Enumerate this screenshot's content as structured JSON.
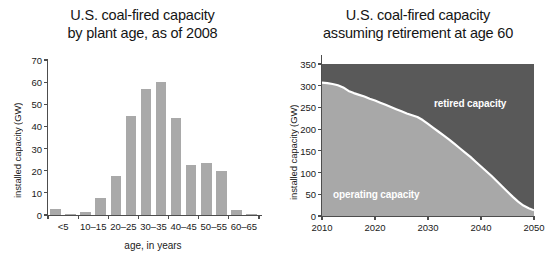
{
  "chart_data": [
    {
      "type": "bar",
      "id": "coal-capacity-by-plant-age",
      "title": "U.S. coal-fired capacity",
      "title_line2": "by plant age, as of 2008",
      "xlabel": "age, in years",
      "ylabel": "installed capacity (GW)",
      "ylim": [
        0,
        70
      ],
      "yticks": [
        0,
        10,
        20,
        30,
        40,
        50,
        60,
        70
      ],
      "grid": false,
      "bar_color": "#a9a9a9",
      "categories": [
        "<5",
        "5–10",
        "10–15",
        "15–20",
        "20–25",
        "25–30",
        "30–35",
        "35–40",
        "40–45",
        "45–50",
        "50–55",
        "55–60",
        "60–65",
        "65–70"
      ],
      "values": [
        2.5,
        0.5,
        1.3,
        7.8,
        17.7,
        44.8,
        56.8,
        60.0,
        43.7,
        22.5,
        23.5,
        20.0,
        2.2,
        0.5
      ],
      "xtick_labels": [
        "<5",
        "10–15",
        "20–25",
        "30–35",
        "40–45",
        "50–55",
        "60–65"
      ],
      "xtick_label_indices": [
        0,
        2,
        4,
        6,
        8,
        10,
        12
      ]
    },
    {
      "type": "area",
      "id": "coal-capacity-retirement-at-60",
      "title": "U.S. coal-fired capacity",
      "title_line2": "assuming retirement at age 60",
      "xlabel": "",
      "ylabel": "installed capacity (GW)",
      "ylim": [
        0,
        350
      ],
      "yticks": [
        0,
        50,
        100,
        150,
        200,
        250,
        300,
        350
      ],
      "xlim": [
        2010,
        2050
      ],
      "xticks": [
        2010,
        2020,
        2030,
        2040,
        2050
      ],
      "xtick_labels": [
        "2010",
        "2020",
        "2030",
        "2040",
        "2050"
      ],
      "grid": false,
      "legend_position": "inline-annotation",
      "annotations": [
        {
          "name": "retired-capacity",
          "text": "retired capacity",
          "color": "#ffffff"
        },
        {
          "name": "operating-capacity",
          "text": "operating capacity",
          "color": "#ffffff"
        }
      ],
      "colors": {
        "operating": "#a8a8a8",
        "retired": "#595959",
        "divider": "#ffffff"
      },
      "x": [
        2010,
        2011,
        2012,
        2013,
        2014,
        2015,
        2016,
        2017,
        2018,
        2019,
        2020,
        2021,
        2022,
        2023,
        2024,
        2025,
        2026,
        2027,
        2028,
        2029,
        2030,
        2031,
        2032,
        2033,
        2034,
        2035,
        2036,
        2037,
        2038,
        2039,
        2040,
        2041,
        2042,
        2043,
        2044,
        2045,
        2046,
        2047,
        2048,
        2049,
        2050
      ],
      "series": [
        {
          "name": "operating capacity",
          "values": [
            307,
            306,
            304,
            301,
            296,
            288,
            283,
            279,
            275,
            270,
            266,
            261,
            256,
            251,
            246,
            241,
            236,
            232,
            228,
            221,
            212,
            203,
            194,
            185,
            176,
            166,
            156,
            146,
            136,
            125,
            114,
            103,
            92,
            80,
            68,
            56,
            44,
            33,
            24,
            18,
            13
          ]
        },
        {
          "name": "retired capacity",
          "values": [
            0,
            1,
            3,
            6,
            11,
            19,
            24,
            28,
            32,
            37,
            41,
            46,
            51,
            56,
            61,
            66,
            71,
            75,
            79,
            86,
            95,
            104,
            113,
            122,
            131,
            141,
            151,
            161,
            171,
            182,
            193,
            204,
            215,
            227,
            239,
            251,
            263,
            274,
            283,
            289,
            294
          ]
        }
      ]
    }
  ]
}
